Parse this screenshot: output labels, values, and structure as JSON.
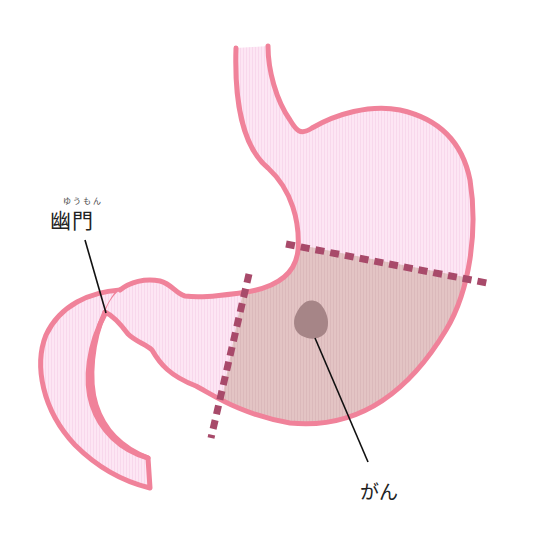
{
  "diagram": {
    "type": "anatomy-illustration",
    "colors": {
      "outline": "#f0829a",
      "fill_normal": "#fde6f4",
      "fill_resected": "#e3c4c4",
      "tumor": "#a68587",
      "cut_line": "#a84a6a",
      "leader_line": "#111111"
    },
    "labels": {
      "pylorus": "幽門",
      "pylorus_reading": "ゆうもん",
      "cancer": "がん"
    },
    "regions": [
      {
        "name": "esophagus"
      },
      {
        "name": "stomach-upper"
      },
      {
        "name": "stomach-lower-resection-area"
      },
      {
        "name": "pylorus"
      },
      {
        "name": "duodenum"
      }
    ],
    "annotations": [
      {
        "name": "cut-line-upper",
        "style": "dashed"
      },
      {
        "name": "cut-line-lower",
        "style": "dashed"
      },
      {
        "name": "tumor"
      }
    ]
  }
}
